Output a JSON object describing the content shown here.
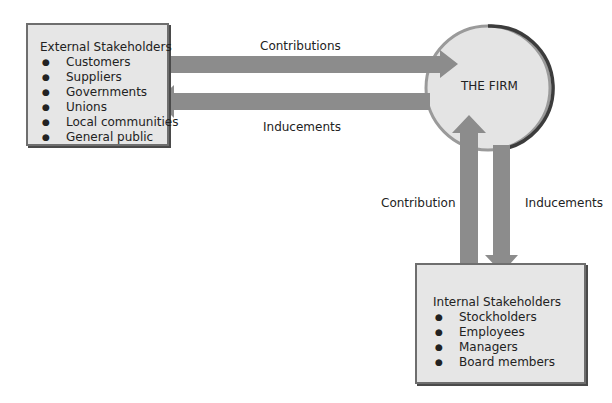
{
  "external": {
    "title": "External Stakeholders",
    "items": [
      "Customers",
      "Suppliers",
      "Governments",
      "Unions",
      "Local communities",
      "General public"
    ]
  },
  "internal": {
    "title": "Internal Stakeholders",
    "items": [
      "Stockholders",
      "Employees",
      "Managers",
      "Board members"
    ]
  },
  "firm": {
    "label": "THE FIRM"
  },
  "arrows": {
    "external_to_firm": "Contributions",
    "firm_to_external": "Inducements",
    "internal_to_firm": "Contribution",
    "firm_to_internal": "Inducements"
  },
  "colors": {
    "arrow": "#8c8c8c",
    "box_fill": "#e6e6e6",
    "circle_fill": "#e4e4e4",
    "circle_dark_edge": "#3c3c3c"
  }
}
